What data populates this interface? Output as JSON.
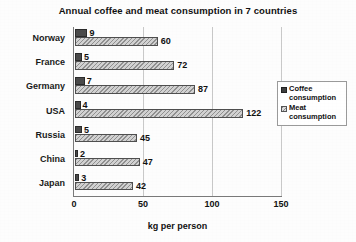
{
  "chart_data": {
    "type": "bar",
    "orientation": "horizontal",
    "title": "Annual coffee and meat consumption in 7 countries",
    "xlabel": "kg per person",
    "ylabel": "",
    "categories": [
      "Norway",
      "France",
      "Germany",
      "USA",
      "Russia",
      "China",
      "Japan"
    ],
    "series": [
      {
        "name": "Coffee consumption",
        "values": [
          9,
          5,
          7,
          4,
          5,
          2,
          3
        ],
        "color": "#4a4a4a",
        "pattern": "solid"
      },
      {
        "name": "Meat consumption",
        "values": [
          60,
          72,
          87,
          122,
          45,
          47,
          42
        ],
        "color": "#d2d2d2",
        "pattern": "hatched"
      }
    ],
    "xlim": [
      0,
      150
    ],
    "xticks": [
      0,
      50,
      100,
      150
    ],
    "xtick_labels": [
      "0",
      "50",
      "100",
      "150"
    ],
    "grid": "vertical",
    "legend_position": "right",
    "data_labels": true
  },
  "legend": {
    "items": [
      {
        "line1": "Coffee",
        "line2": "consumption",
        "swatch": "coffee-swatch"
      },
      {
        "line1": "Meat",
        "line2": "consumption",
        "swatch": "meat-swatch"
      }
    ]
  }
}
